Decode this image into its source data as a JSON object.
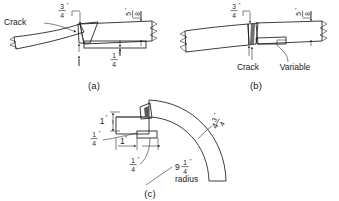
{
  "figure": {
    "name": "weld-repair-detail-figure",
    "background_color": "#ffffff",
    "line_color": "#1a1a1a",
    "base_metal_fill": "#cfcfcf",
    "weld_fill": "#8c8c8c",
    "plate_fill": "#e2e2e2",
    "panels": [
      {
        "id": "a",
        "caption": "(a)",
        "labels": {
          "crack": "Crack"
        },
        "dimensions": [
          {
            "whole": "",
            "numerator": "3",
            "denominator": "4",
            "unit": "″",
            "position": "top-left",
            "rotated": false
          },
          {
            "whole": "",
            "numerator": "5",
            "denominator": "8",
            "unit": "″",
            "position": "top-right",
            "rotated": true
          },
          {
            "whole": "",
            "numerator": "1",
            "denominator": "4",
            "unit": "″",
            "position": "bottom-center",
            "rotated": false
          }
        ]
      },
      {
        "id": "b",
        "caption": "(b)",
        "labels": {
          "crack": "Crack",
          "variable": "Variable"
        },
        "dimensions": [
          {
            "whole": "",
            "numerator": "3",
            "denominator": "4",
            "unit": "″",
            "position": "top-left",
            "rotated": false
          },
          {
            "whole": "",
            "numerator": "5",
            "denominator": "8",
            "unit": "″",
            "position": "top-right",
            "rotated": true
          }
        ]
      },
      {
        "id": "c",
        "caption": "(c)",
        "labels": {
          "radius": "radius"
        },
        "dimensions": [
          {
            "whole": "1",
            "numerator": "",
            "denominator": "",
            "unit": "″",
            "position": "left-upper",
            "rotated": false
          },
          {
            "whole": "",
            "numerator": "1",
            "denominator": "4",
            "unit": "″",
            "position": "left-lower",
            "rotated": false
          },
          {
            "whole": "1",
            "numerator": "",
            "denominator": "",
            "unit": "″",
            "position": "bottom-left",
            "rotated": false
          },
          {
            "whole": "",
            "numerator": "1",
            "denominator": "4",
            "unit": "″",
            "position": "bottom-center",
            "rotated": false
          },
          {
            "whole": "4",
            "numerator": "3",
            "denominator": "4",
            "unit": "″",
            "position": "right-curve",
            "rotated": true
          },
          {
            "whole": "9",
            "numerator": "1",
            "denominator": "4",
            "unit": "″",
            "position": "radius-leader",
            "rotated": false
          }
        ]
      }
    ]
  }
}
